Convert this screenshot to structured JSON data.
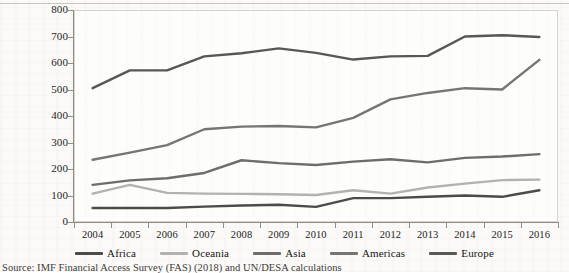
{
  "figure": {
    "source_note": "Source: IMF Financial Access Survey (FAS) (2018) and UN/DESA calculations",
    "frame_border_color": "#d7d4ce",
    "axis_color": "#8f8b85",
    "page_background": "#fbfaf8"
  },
  "chart_data": {
    "type": "line",
    "title": "",
    "xlabel": "",
    "ylabel": "",
    "ylim": [
      0,
      800
    ],
    "ytick_labels": [
      "800",
      "700",
      "600",
      "500",
      "400",
      "300",
      "200",
      "100",
      "0"
    ],
    "yticks": [
      800,
      700,
      600,
      500,
      400,
      300,
      200,
      100,
      0
    ],
    "grid": false,
    "legend_position": "bottom",
    "categories": [
      "2004",
      "2005",
      "2006",
      "2007",
      "2008",
      "2009",
      "2010",
      "2011",
      "2012",
      "2013",
      "2014",
      "2015",
      "2016"
    ],
    "x": [
      2004,
      2005,
      2006,
      2007,
      2008,
      2009,
      2010,
      2011,
      2012,
      2013,
      2014,
      2015,
      2016
    ],
    "series": [
      {
        "name": "Africa",
        "color": "#4c4b49",
        "values": [
          53,
          53,
          53,
          58,
          62,
          65,
          57,
          90,
          90,
          95,
          100,
          95,
          120
        ]
      },
      {
        "name": "Oceania",
        "color": "#b3b2ae",
        "values": [
          107,
          140,
          110,
          107,
          106,
          105,
          102,
          120,
          107,
          130,
          145,
          158,
          160
        ]
      },
      {
        "name": "Asia",
        "color": "#6e6d6a",
        "values": [
          140,
          157,
          165,
          185,
          233,
          222,
          215,
          228,
          237,
          225,
          242,
          247,
          256
        ]
      },
      {
        "name": "Americas",
        "color": "#767572",
        "values": [
          235,
          262,
          290,
          350,
          360,
          362,
          357,
          393,
          463,
          487,
          505,
          500,
          612
        ]
      },
      {
        "name": "Europe",
        "color": "#585754",
        "values": [
          505,
          572,
          572,
          625,
          637,
          655,
          638,
          613,
          625,
          627,
          700,
          705,
          698
        ]
      }
    ]
  }
}
